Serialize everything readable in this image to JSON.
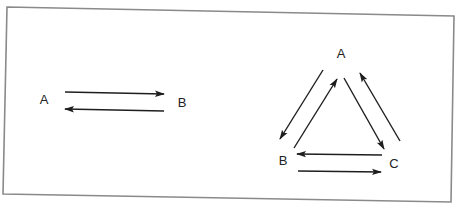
{
  "colors": {
    "background": "#ffffff",
    "frame": "#8a8a8a",
    "ink": "#1e1e1e",
    "text": "#222222"
  },
  "frame": {
    "corners": [
      [
        7,
        7
      ],
      [
        454,
        16
      ],
      [
        451,
        202
      ],
      [
        3,
        194
      ]
    ]
  },
  "diagrams": [
    {
      "name": "two-node-cycle",
      "nodes": [
        {
          "id": "A",
          "label": "A",
          "x": 44,
          "y": 104
        },
        {
          "id": "B",
          "label": "B",
          "x": 182,
          "y": 107
        }
      ],
      "edges": [
        {
          "from": "A",
          "to": "B",
          "x1": 65,
          "y1": 92,
          "x2": 164,
          "y2": 94
        },
        {
          "from": "B",
          "to": "A",
          "x1": 164,
          "y1": 111,
          "x2": 65,
          "y2": 109
        }
      ]
    },
    {
      "name": "three-node-cycle",
      "nodes": [
        {
          "id": "A",
          "label": "A",
          "x": 341,
          "y": 58
        },
        {
          "id": "B",
          "label": "B",
          "x": 283,
          "y": 165
        },
        {
          "id": "C",
          "label": "C",
          "x": 394,
          "y": 168
        }
      ],
      "edges": [
        {
          "from": "A",
          "to": "B",
          "x1": 323,
          "y1": 70,
          "x2": 280,
          "y2": 139
        },
        {
          "from": "B",
          "to": "A",
          "x1": 294,
          "y1": 148,
          "x2": 337,
          "y2": 79
        },
        {
          "from": "A",
          "to": "C",
          "x1": 344,
          "y1": 78,
          "x2": 384,
          "y2": 149
        },
        {
          "from": "C",
          "to": "A",
          "x1": 400,
          "y1": 141,
          "x2": 360,
          "y2": 73
        },
        {
          "from": "C",
          "to": "B",
          "x1": 382,
          "y1": 155,
          "x2": 297,
          "y2": 154
        },
        {
          "from": "B",
          "to": "C",
          "x1": 298,
          "y1": 171,
          "x2": 381,
          "y2": 172
        }
      ]
    }
  ]
}
